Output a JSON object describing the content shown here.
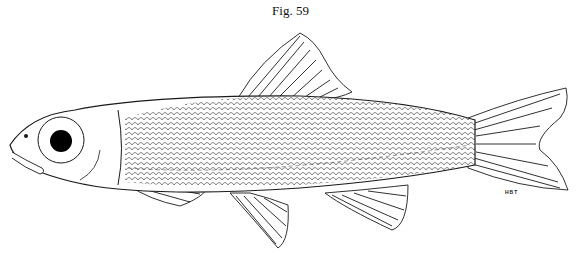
{
  "figure": {
    "caption": "Fig. 59",
    "artist_initials": "HBT",
    "colors": {
      "ink": "#1a1a1a",
      "background": "#ffffff",
      "eye": "#000000"
    }
  }
}
